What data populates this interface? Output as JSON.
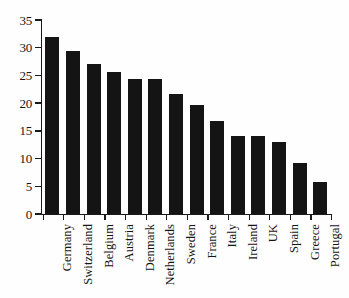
{
  "chart_data": {
    "type": "bar",
    "title": "",
    "subtitle": "",
    "xlabel": "",
    "ylabel": "",
    "ylim": [
      0,
      35
    ],
    "ytick_step": 5,
    "yticks": [
      0,
      5,
      10,
      15,
      20,
      25,
      30,
      35
    ],
    "ytick_labels": [
      "0",
      "5",
      "10",
      "15",
      "20",
      "25",
      "30",
      "35"
    ],
    "grid": false,
    "legend": null,
    "orientation": "vertical",
    "bar_color": "#141414",
    "axis_color": "#1b1b1b",
    "background_color": "#fefefe",
    "label_rotation": -90,
    "categories": [
      "Germany",
      "Switzerland",
      "Belgium",
      "Austria",
      "Denmark",
      "Netherlands",
      "Sweden",
      "France",
      "Italy",
      "Ireland",
      "UK",
      "Spain",
      "Greece",
      "Portugal"
    ],
    "values": [
      32.0,
      29.5,
      27.0,
      25.6,
      24.4,
      24.4,
      21.6,
      19.6,
      16.7,
      14.1,
      14.1,
      13.0,
      9.2,
      5.7
    ]
  }
}
